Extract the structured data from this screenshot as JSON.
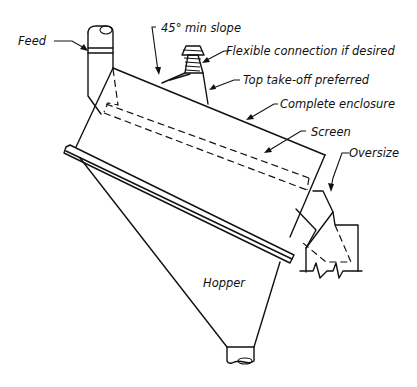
{
  "diagram": {
    "type": "screen-enclosure-schematic",
    "labels": {
      "feed": "Feed",
      "min_slope": "45° min slope",
      "flexible_connection": "Flexible connection if desired",
      "top_takeoff": "Top take-off preferred",
      "complete_enclosure": "Complete enclosure",
      "screen": "Screen",
      "oversize": "Oversize",
      "hopper": "Hopper"
    },
    "colors": {
      "line": "#111111",
      "background": "#ffffff"
    }
  }
}
